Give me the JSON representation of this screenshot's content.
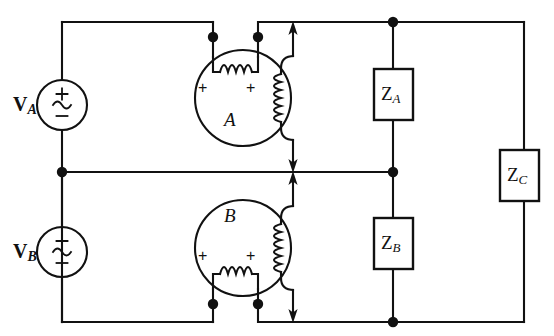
{
  "diagram": {
    "background": "#ffffff",
    "stroke": "#111111",
    "width": 554,
    "height": 336
  },
  "sources": [
    {
      "id": "source-a",
      "label": "V",
      "subscript": "A",
      "plus": "+",
      "minus": "−",
      "waveform": "~",
      "cx": 62,
      "cy": 105,
      "r": 25
    },
    {
      "id": "source-b",
      "label": "V",
      "subscript": "B",
      "plus": "+",
      "minus": "−",
      "waveform": "~",
      "cx": 62,
      "cy": 252,
      "r": 25
    }
  ],
  "machines": [
    {
      "id": "machine-a",
      "label": "A",
      "cx": 243,
      "cy": 98,
      "r": 48,
      "terminal_plus_left": "+",
      "terminal_plus_right": "+",
      "coil_orientation_primary": "horizontal-top",
      "coil_orientation_secondary": "vertical-right"
    },
    {
      "id": "machine-b",
      "label": "B",
      "cx": 243,
      "cy": 248,
      "r": 48,
      "terminal_plus_left": "+",
      "terminal_plus_right": "+",
      "coil_orientation_primary": "horizontal-bottom",
      "coil_orientation_secondary": "vertical-right"
    }
  ],
  "impedances": [
    {
      "id": "impedance-a",
      "label": "Z",
      "subscript": "A",
      "x": 374,
      "y": 69,
      "w": 39,
      "h": 51
    },
    {
      "id": "impedance-b",
      "label": "Z",
      "subscript": "B",
      "x": 374,
      "y": 218,
      "w": 39,
      "h": 51
    },
    {
      "id": "impedance-c",
      "label": "Z",
      "subscript": "C",
      "x": 500,
      "y": 150,
      "w": 39,
      "h": 51
    }
  ],
  "nodes": [
    {
      "id": "node-top-left-coil",
      "x": 213,
      "y": 37
    },
    {
      "id": "node-top-right-coil",
      "x": 258,
      "y": 37
    },
    {
      "id": "node-top-za",
      "x": 393,
      "y": 22
    },
    {
      "id": "node-mid-left",
      "x": 62,
      "y": 172
    },
    {
      "id": "node-mid-zb",
      "x": 393,
      "y": 172
    },
    {
      "id": "node-bot-left-coil",
      "x": 213,
      "y": 304
    },
    {
      "id": "node-bot-right-coil",
      "x": 258,
      "y": 304
    },
    {
      "id": "node-bot-zb",
      "x": 393,
      "y": 322
    }
  ],
  "arrows": [
    {
      "id": "arrow-a-up",
      "from": [
        293,
        130
      ],
      "to": [
        293,
        22
      ],
      "direction": "up"
    },
    {
      "id": "arrow-a-down",
      "from": [
        293,
        140
      ],
      "to": [
        293,
        172
      ],
      "direction": "down"
    },
    {
      "id": "arrow-b-up",
      "from": [
        293,
        216
      ],
      "to": [
        293,
        172
      ],
      "direction": "up"
    },
    {
      "id": "arrow-b-down",
      "from": [
        293,
        226
      ],
      "to": [
        293,
        322
      ],
      "direction": "down"
    }
  ],
  "wires": {
    "top_rail_y": 22,
    "middle_rail_y": 172,
    "bottom_rail_y": 322,
    "left_rail_x": 62,
    "right_rail_x": 524,
    "za_rail_x": 393
  }
}
